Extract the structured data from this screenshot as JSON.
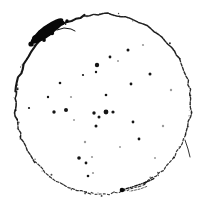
{
  "image": {
    "title": "Binarized circular contour scan",
    "width": 205,
    "height": 203,
    "background_color": "#ffffff",
    "ink_color": "#0d0d0d",
    "faint_ink_color": "#9a9a9a",
    "blob_color": "#080808"
  },
  "contour": {
    "name": "outer-ring",
    "description": "closed, slightly irregular hand-drawn circle rendered as a dashed/speckled binarized stroke",
    "center_x": 103,
    "center_y": 104,
    "radius_x": 88,
    "radius_y": 90,
    "closed": true,
    "segments": [
      {
        "name": "arc-top-left-thick",
        "start_angle_deg": 188,
        "end_angle_deg": 258,
        "stroke_width": 2.1,
        "opacity": 0.96,
        "dash": "7 0.6"
      },
      {
        "name": "arc-top-right",
        "start_angle_deg": 258,
        "end_angle_deg": 330,
        "stroke_width": 1.5,
        "opacity": 0.92,
        "dash": "4 1.1"
      },
      {
        "name": "arc-right-upper",
        "start_angle_deg": 330,
        "end_angle_deg": 20,
        "stroke_width": 1.35,
        "opacity": 0.88,
        "dash": "3 1.6"
      },
      {
        "name": "arc-right-lower",
        "start_angle_deg": 20,
        "end_angle_deg": 62,
        "stroke_width": 1.25,
        "opacity": 0.82,
        "dash": "2.4 1.9"
      },
      {
        "name": "arc-bottom-right",
        "start_angle_deg": 62,
        "end_angle_deg": 98,
        "stroke_width": 1.15,
        "opacity": 0.8,
        "dash": "2 2.2"
      },
      {
        "name": "arc-bottom-left",
        "start_angle_deg": 98,
        "end_angle_deg": 140,
        "stroke_width": 1.2,
        "opacity": 0.85,
        "dash": "2.6 1.7"
      },
      {
        "name": "arc-left-lower",
        "start_angle_deg": 140,
        "end_angle_deg": 170,
        "stroke_width": 1.4,
        "opacity": 0.9,
        "dash": "3.2 1.5"
      },
      {
        "name": "arc-left-upper",
        "start_angle_deg": 170,
        "end_angle_deg": 188,
        "stroke_width": 1.6,
        "opacity": 0.93,
        "dash": "5 1"
      }
    ]
  },
  "deposit": {
    "name": "upper-left-ink-blob",
    "description": "dense saturated ink deposit thickening the rim at the upper-left of the circle",
    "center_x": 47,
    "center_y": 31,
    "length": 40,
    "thickness": 11,
    "rotation_deg": -37,
    "color": "#080808",
    "satellites": [
      {
        "x": 36,
        "y": 39,
        "r": 4.0
      },
      {
        "x": 42,
        "y": 34,
        "r": 4.6
      },
      {
        "x": 49,
        "y": 29,
        "r": 4.4
      },
      {
        "x": 56,
        "y": 26,
        "r": 3.4
      },
      {
        "x": 62,
        "y": 23,
        "r": 2.4
      },
      {
        "x": 31,
        "y": 44,
        "r": 2.6
      },
      {
        "x": 67,
        "y": 21,
        "r": 1.7
      },
      {
        "x": 52,
        "y": 33,
        "r": 2.2
      },
      {
        "x": 44,
        "y": 40,
        "r": 1.9
      }
    ],
    "whisker": {
      "name": "blob-whisker",
      "points": "57,30 64,28 71,29 75,31",
      "stroke_width": 1.0
    }
  },
  "bottom_feature": {
    "name": "bottom-branch-artifact",
    "description": "small dark node with a short branching tail crossing the rim near the bottom of the circle",
    "node": {
      "x": 122,
      "y": 190,
      "r": 2.3
    },
    "branch_points": "122,190 132,187 141,184 149,181 155,178",
    "branch_stroke_width": 1.3,
    "secondary_points": "131,191 140,189 148,186",
    "secondary_stroke_width": 0.9
  },
  "right_kink": {
    "name": "right-rim-kink",
    "description": "short secondary line diverging from the rim on the lower right",
    "points": "185,140 188,149 190,157",
    "stroke_width": 1.0
  },
  "specks": {
    "name": "interior-speck-field",
    "description": "scattered dark pixel clusters distributed across the interior of the circle",
    "count": 34,
    "points": [
      {
        "x": 128,
        "y": 50,
        "r": 1.5,
        "faint": false
      },
      {
        "x": 110,
        "y": 57,
        "r": 1.4,
        "faint": false
      },
      {
        "x": 97,
        "y": 65,
        "r": 2.2,
        "faint": false
      },
      {
        "x": 96,
        "y": 72,
        "r": 1.2,
        "faint": false
      },
      {
        "x": 150,
        "y": 74,
        "r": 1.5,
        "faint": false
      },
      {
        "x": 131,
        "y": 84,
        "r": 1.4,
        "faint": false
      },
      {
        "x": 60,
        "y": 83,
        "r": 1.3,
        "faint": false
      },
      {
        "x": 83,
        "y": 75,
        "r": 1.1,
        "faint": false
      },
      {
        "x": 171,
        "y": 90,
        "r": 1.2,
        "faint": true
      },
      {
        "x": 48,
        "y": 97,
        "r": 1.2,
        "faint": false
      },
      {
        "x": 71,
        "y": 97,
        "r": 1.1,
        "faint": true
      },
      {
        "x": 106,
        "y": 95,
        "r": 1.3,
        "faint": false
      },
      {
        "x": 54,
        "y": 112,
        "r": 1.7,
        "faint": false
      },
      {
        "x": 66,
        "y": 110,
        "r": 2.0,
        "faint": false
      },
      {
        "x": 94,
        "y": 113,
        "r": 1.7,
        "faint": false
      },
      {
        "x": 106,
        "y": 112,
        "r": 2.4,
        "faint": false
      },
      {
        "x": 113,
        "y": 112,
        "r": 1.6,
        "faint": false
      },
      {
        "x": 99,
        "y": 117,
        "r": 1.5,
        "faint": false
      },
      {
        "x": 96,
        "y": 126,
        "r": 1.5,
        "faint": false
      },
      {
        "x": 133,
        "y": 122,
        "r": 1.4,
        "faint": false
      },
      {
        "x": 163,
        "y": 126,
        "r": 1.2,
        "faint": true
      },
      {
        "x": 29,
        "y": 108,
        "r": 1.1,
        "faint": false
      },
      {
        "x": 139,
        "y": 139,
        "r": 1.4,
        "faint": false
      },
      {
        "x": 85,
        "y": 142,
        "r": 1.2,
        "faint": true
      },
      {
        "x": 79,
        "y": 158,
        "r": 1.8,
        "faint": false
      },
      {
        "x": 86,
        "y": 163,
        "r": 1.4,
        "faint": false
      },
      {
        "x": 92,
        "y": 157,
        "r": 1.1,
        "faint": true
      },
      {
        "x": 155,
        "y": 158,
        "r": 1.0,
        "faint": true
      },
      {
        "x": 88,
        "y": 176,
        "r": 1.3,
        "faint": false
      },
      {
        "x": 93,
        "y": 173,
        "r": 1.1,
        "faint": true
      },
      {
        "x": 118,
        "y": 61,
        "r": 1.0,
        "faint": true
      },
      {
        "x": 143,
        "y": 45,
        "r": 1.1,
        "faint": true
      },
      {
        "x": 74,
        "y": 120,
        "r": 1.0,
        "faint": true
      },
      {
        "x": 120,
        "y": 147,
        "r": 1.0,
        "faint": true
      }
    ]
  }
}
